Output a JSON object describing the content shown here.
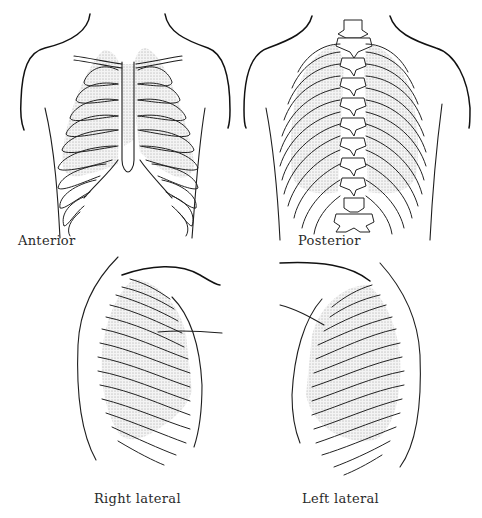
{
  "figure": {
    "panels": [
      {
        "id": "anterior",
        "label": "Anterior"
      },
      {
        "id": "posterior",
        "label": "Posterior"
      },
      {
        "id": "right-lateral",
        "label": "Right lateral"
      },
      {
        "id": "left-lateral",
        "label": "Left lateral"
      }
    ]
  },
  "colors": {
    "line": "#1e1e1e",
    "stipple": "#555555",
    "background": "#ffffff"
  }
}
